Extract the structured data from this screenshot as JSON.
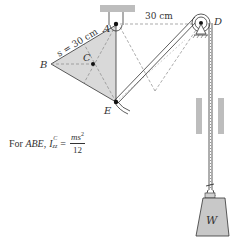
{
  "diagram": {
    "labels": {
      "A": "A",
      "B": "B",
      "C": "C",
      "D": "D",
      "E": "E",
      "W": "W",
      "side_length": "s = 30 cm",
      "horizontal_distance": "30 cm"
    },
    "formula": {
      "prefix": "For ",
      "body": "ABE",
      "comma": ",",
      "symbol": "I",
      "superscript": "C",
      "subscript": "zz",
      "equals": "=",
      "numerator": "ms",
      "numerator_power": "2",
      "denominator": "12"
    },
    "colors": {
      "plate_fill": "#d9d9d9",
      "support_fill": "#bdbdbd",
      "weight_fill": "#c8c8c8",
      "line": "#333333",
      "dashed": "#888888"
    }
  }
}
